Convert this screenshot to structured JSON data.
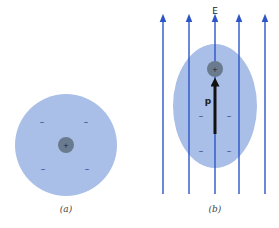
{
  "panels": {
    "a": {
      "caption": "(a)",
      "cloud_color": "#a9bfe8",
      "nucleus_color": "#6b7b8f",
      "nucleus_sign": "+",
      "electron_sign": "–"
    },
    "b": {
      "caption": "(b)",
      "field_label": "E",
      "dipole_label": "p",
      "cloud_color": "#a9bfe8",
      "nucleus_color": "#6b7b8f",
      "nucleus_sign": "+",
      "electron_sign": "–",
      "field_line_color": "#2d55c8",
      "field_line_count": 5
    }
  }
}
